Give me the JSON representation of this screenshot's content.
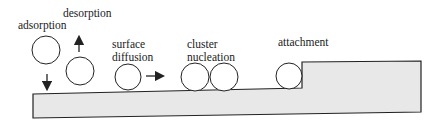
{
  "diagram": {
    "type": "thin-film growth processes",
    "processes": [
      {
        "id": "adsorption",
        "label": "adsorption",
        "arrow": "down"
      },
      {
        "id": "desorption",
        "label": "desorption",
        "arrow": "up"
      },
      {
        "id": "surface-diffusion",
        "label_line1": "surface",
        "label_line2": "diffusion",
        "arrow": "right"
      },
      {
        "id": "cluster-nucleation",
        "label_line1": "cluster",
        "label_line2": "nucleation"
      },
      {
        "id": "attachment",
        "label": "attachment"
      }
    ],
    "colors": {
      "substrate_fill": "#e8e8e8",
      "stroke": "#222222",
      "background": "#ffffff"
    }
  }
}
